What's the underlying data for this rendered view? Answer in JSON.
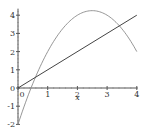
{
  "chart_data": {
    "type": "line",
    "title": "",
    "xlabel": "x",
    "ylabel": "",
    "xlim": [
      0,
      4
    ],
    "ylim": [
      -2,
      4.25
    ],
    "grid": false,
    "legend": null,
    "x_ticks": [
      0,
      1,
      2,
      3,
      4
    ],
    "y_ticks": [
      -2,
      -1,
      0,
      1,
      2,
      3,
      4
    ],
    "series": [
      {
        "name": "y = -x^2 + 5x - 2",
        "color": "#8a8a8a",
        "x": [
          0,
          0.25,
          0.5,
          0.75,
          1,
          1.25,
          1.5,
          1.75,
          2,
          2.25,
          2.5,
          2.75,
          3,
          3.25,
          3.5,
          3.75,
          4
        ],
        "values": [
          -2,
          -0.81,
          0.25,
          1.19,
          2,
          2.69,
          3.25,
          3.69,
          4,
          4.19,
          4.25,
          4.19,
          4,
          3.69,
          3.25,
          2.69,
          2
        ]
      },
      {
        "name": "y = x",
        "color": "#444444",
        "x": [
          0,
          4
        ],
        "values": [
          0,
          4
        ]
      }
    ]
  },
  "axes": {
    "x_tick_labels": [
      "0",
      "1",
      "2",
      "3",
      "4"
    ],
    "y_tick_labels": [
      "4",
      "3",
      "2",
      "1",
      "0",
      "-1",
      "-2"
    ],
    "x_axis_label": "x"
  }
}
